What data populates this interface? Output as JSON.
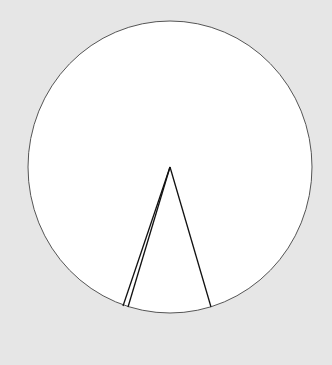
{
  "canvas": {
    "width": 332,
    "height": 365,
    "background": "#e6e6e6"
  },
  "circle": {
    "cx": 170,
    "cy": 167,
    "rx": 142,
    "ry": 146,
    "fill": "#ffffff",
    "stroke": "#555555"
  },
  "lines": [
    {
      "x1": 170,
      "y1": 167,
      "x2": 123,
      "y2": 306
    },
    {
      "x1": 170,
      "y1": 167,
      "x2": 128,
      "y2": 307
    },
    {
      "x1": 170,
      "y1": 167,
      "x2": 211,
      "y2": 307
    }
  ],
  "line_color": "#111111"
}
